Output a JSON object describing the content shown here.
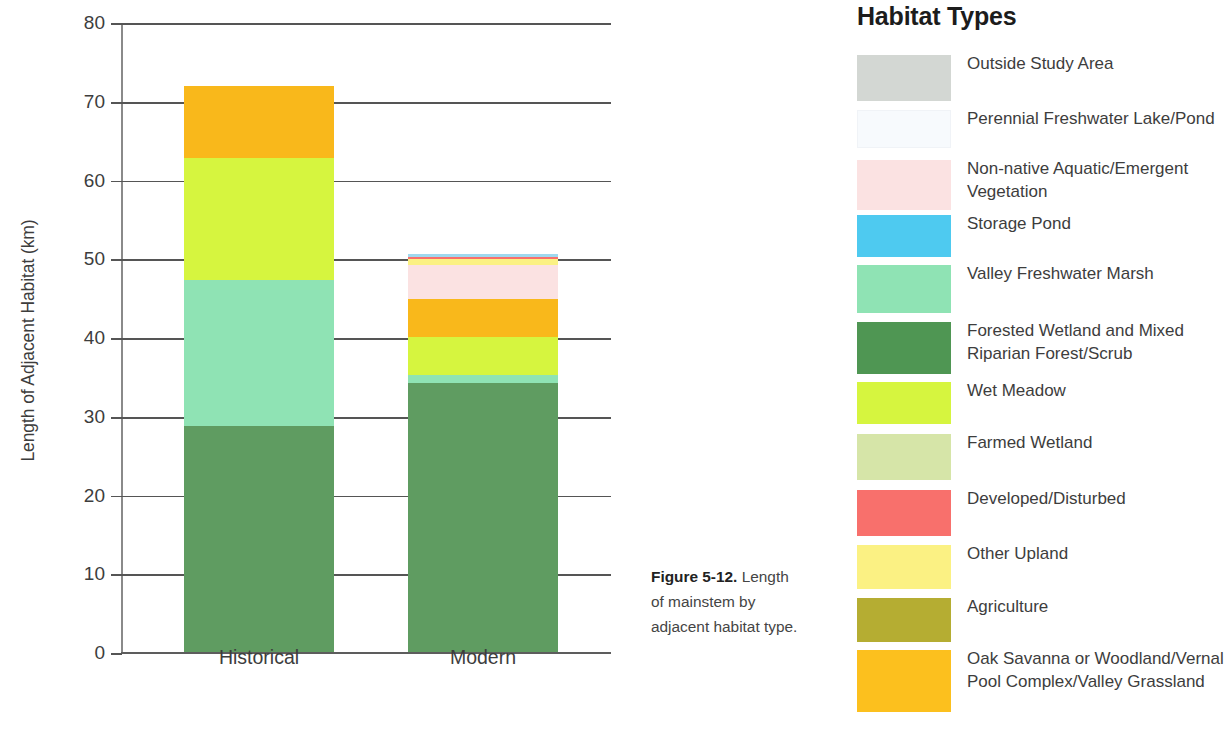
{
  "caption": {
    "figure_number": "Figure 5-12.",
    "text": " Length of mainstem by adjacent habitat type."
  },
  "legend": {
    "title": "Habitat Types",
    "items": [
      {
        "label": "Outside Study Area",
        "color": "#d3d7d3"
      },
      {
        "label": "Perennial Freshwater Lake/Pond",
        "color": "#f7fafd"
      },
      {
        "label": "Non-native Aquatic/Emergent Vegetation",
        "color": "#fbe2e2"
      },
      {
        "label": "Storage Pond",
        "color": "#4ecaf0"
      },
      {
        "label": "Valley Freshwater Marsh",
        "color": "#8fe3b4"
      },
      {
        "label": "Forested Wetland and Mixed Riparian Forest/Scrub",
        "color": "#4f9653"
      },
      {
        "label": "Wet Meadow",
        "color": "#d6f53f"
      },
      {
        "label": "Farmed Wetland",
        "color": "#d6e5a8"
      },
      {
        "label": "Developed/Disturbed",
        "color": "#f8706c"
      },
      {
        "label": "Other Upland",
        "color": "#fbf183"
      },
      {
        "label": "Agriculture",
        "color": "#b5ad32"
      },
      {
        "label": "Oak Savanna or Woodland/Vernal Pool Complex/Valley Grassland",
        "color": "#fcc01e"
      }
    ]
  },
  "chart_data": {
    "type": "bar",
    "stacked": true,
    "title": "",
    "xlabel": "",
    "ylabel": "Length of Adjacent Habitat (km)",
    "ylim": [
      0,
      80
    ],
    "yticks": [
      0,
      10,
      20,
      30,
      40,
      50,
      60,
      70,
      80
    ],
    "ytick_labels": [
      "0",
      "10",
      "20",
      "30",
      "40",
      "50",
      "60",
      "70",
      "80"
    ],
    "grid": "horizontal",
    "legend_position": "right",
    "categories": [
      "Historical",
      "Modern"
    ],
    "series": [
      {
        "name": "Forested Wetland and Mixed Riparian Forest/Scrub",
        "color": "#5f9c61",
        "values": [
          28.7,
          34.2
        ]
      },
      {
        "name": "Valley Freshwater Marsh",
        "color": "#8fe3b4",
        "values": [
          18.6,
          1.0
        ]
      },
      {
        "name": "Wet Meadow",
        "color": "#d6f53f",
        "values": [
          15.5,
          4.8
        ]
      },
      {
        "name": "Oak Savanna or Woodland/Vernal Pool Complex/Valley Grassland",
        "color": "#f9b81b",
        "values": [
          9.0,
          4.9
        ]
      },
      {
        "name": "Non-native Aquatic/Emergent Vegetation",
        "color": "#fbe2e2",
        "values": [
          0,
          4.3
        ]
      },
      {
        "name": "Other Upland",
        "color": "#fbf183",
        "values": [
          0,
          0.7
        ]
      },
      {
        "name": "Developed/Disturbed",
        "color": "#f8706c",
        "values": [
          0,
          0.25
        ]
      },
      {
        "name": "Storage Pond",
        "color": "#9fd9ef",
        "values": [
          0,
          0.35
        ]
      }
    ],
    "totals": [
      71.8,
      50.5
    ]
  }
}
